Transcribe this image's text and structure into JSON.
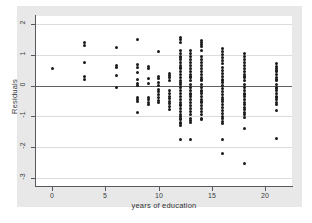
{
  "figure": {
    "background_color": "#e8e8e8",
    "plot_background_color": "#ffffff",
    "point_color": "#1b1b1d",
    "grid_color": "#dcdcde",
    "axis_color": "#55585c",
    "zero_line_color": "#5c6064"
  },
  "chart_data": {
    "type": "scatter",
    "title": "",
    "subtitle": "",
    "xlabel": "years of education",
    "ylabel": "Residuals",
    "xlim": [
      -1.5,
      22.5
    ],
    "ylim": [
      -3.25,
      2.25
    ],
    "xticks": [
      0,
      5,
      10,
      15,
      20
    ],
    "xticklabels": [
      "0",
      "5",
      "10",
      "15",
      "20"
    ],
    "yticks": [
      2,
      1,
      0,
      -1,
      -2,
      -3
    ],
    "yticklabels": [
      "2",
      "1",
      "0",
      "-1",
      "-2",
      "-3"
    ],
    "grid": true,
    "grid_axis": "y",
    "reference_line": {
      "y": 0,
      "style": "solid"
    },
    "legend": null,
    "marker": "filled-circle",
    "series": [
      {
        "name": "residuals",
        "x": [
          0,
          3,
          3,
          3,
          3,
          3,
          6,
          6,
          6,
          6,
          6,
          8,
          8,
          8,
          8,
          8,
          8,
          8,
          8,
          8,
          8,
          8,
          9,
          9,
          9,
          9,
          9,
          9,
          9,
          9,
          10,
          10,
          10,
          10,
          10,
          10,
          10,
          10,
          10,
          10,
          10,
          11,
          11,
          11,
          11,
          11,
          11,
          11,
          11,
          11,
          11,
          11,
          11,
          12,
          12,
          12,
          12,
          12,
          12,
          12,
          12,
          12,
          12,
          12,
          12,
          12,
          12,
          12,
          12,
          12,
          12,
          12,
          12,
          12,
          12,
          12,
          12,
          12,
          12,
          12,
          12,
          12,
          12,
          12,
          12,
          12,
          12,
          12,
          12,
          13,
          13,
          13,
          13,
          13,
          13,
          13,
          13,
          13,
          13,
          13,
          13,
          13,
          13,
          13,
          13,
          13,
          13,
          13,
          13,
          13,
          13,
          13,
          13,
          13,
          13,
          13,
          13,
          14,
          14,
          14,
          14,
          14,
          14,
          14,
          14,
          14,
          14,
          14,
          14,
          14,
          14,
          14,
          14,
          14,
          14,
          14,
          14,
          14,
          14,
          14,
          14,
          14,
          14,
          14,
          14,
          14,
          14,
          16,
          16,
          16,
          16,
          16,
          16,
          16,
          16,
          16,
          16,
          16,
          16,
          16,
          16,
          16,
          16,
          16,
          16,
          16,
          16,
          16,
          16,
          16,
          16,
          16,
          16,
          16,
          16,
          16,
          16,
          18,
          18,
          18,
          18,
          18,
          18,
          18,
          18,
          18,
          18,
          18,
          18,
          18,
          18,
          18,
          18,
          18,
          18,
          18,
          18,
          18,
          18,
          18,
          18,
          18,
          18,
          18,
          21,
          21,
          21,
          21,
          21,
          21,
          21,
          21,
          21,
          21,
          21,
          21,
          21,
          21,
          21,
          21,
          21,
          21,
          21,
          21,
          21
        ],
        "y": [
          0.55,
          1.38,
          1.3,
          0.74,
          0.3,
          0.2,
          1.23,
          0.65,
          0.6,
          0.32,
          -0.07,
          1.49,
          0.68,
          0.6,
          0.42,
          0.18,
          0.08,
          0.0,
          -0.4,
          -0.46,
          -0.52,
          -0.87,
          0.62,
          0.55,
          0.22,
          0.08,
          -0.4,
          -0.46,
          -0.55,
          -0.62,
          1.1,
          0.3,
          0.22,
          0.1,
          0.0,
          -0.12,
          -0.2,
          -0.28,
          -0.38,
          -0.48,
          -0.55,
          0.4,
          0.33,
          0.25,
          0.15,
          -0.15,
          -0.25,
          -0.35,
          -0.42,
          -0.5,
          -0.58,
          -0.68,
          -0.76,
          1.57,
          1.5,
          1.38,
          1.12,
          1.05,
          0.95,
          0.85,
          0.75,
          0.65,
          0.55,
          0.45,
          0.35,
          0.25,
          0.15,
          0.05,
          -0.05,
          -0.15,
          -0.25,
          -0.35,
          -0.45,
          -0.55,
          -0.65,
          -0.75,
          -0.85,
          -0.95,
          -1.0,
          -1.05,
          -1.1,
          -1.18,
          -1.22,
          -1.28,
          -1.75,
          0.9,
          0.6,
          0.1,
          -0.6,
          1.15,
          1.05,
          0.95,
          0.85,
          0.75,
          0.65,
          0.55,
          0.45,
          0.35,
          0.25,
          0.15,
          0.05,
          -0.05,
          -0.15,
          -0.25,
          -0.35,
          -0.45,
          -0.55,
          -0.65,
          -0.75,
          -0.85,
          -0.95,
          -1.05,
          -1.12,
          -1.18,
          -1.75,
          0.3,
          -0.3,
          1.46,
          1.4,
          1.32,
          1.25,
          1.12,
          0.95,
          0.85,
          0.75,
          0.65,
          0.55,
          0.45,
          0.35,
          0.25,
          0.15,
          0.05,
          -0.05,
          -0.15,
          -0.25,
          -0.35,
          -0.45,
          -0.55,
          -0.65,
          -0.75,
          -0.85,
          -0.95,
          -1.05,
          -1.1,
          0.2,
          -0.2,
          -0.5,
          1.2,
          1.1,
          1.0,
          0.9,
          0.8,
          0.7,
          0.6,
          0.5,
          0.4,
          0.3,
          0.2,
          0.1,
          0.0,
          -0.1,
          -0.2,
          -0.3,
          -0.4,
          -0.5,
          -0.6,
          -0.7,
          -0.8,
          -0.9,
          -1.0,
          -1.08,
          -1.15,
          -1.22,
          -1.75,
          -2.2,
          0.15,
          -0.45,
          1.05,
          0.95,
          0.85,
          0.75,
          0.65,
          0.55,
          0.45,
          0.35,
          0.25,
          0.15,
          0.05,
          -0.05,
          -0.15,
          -0.25,
          -0.35,
          -0.45,
          -0.55,
          -0.62,
          -0.7,
          -0.78,
          -0.88,
          -0.95,
          -1.02,
          -1.38,
          -2.53,
          0.3,
          -0.3,
          0.7,
          0.62,
          0.55,
          0.45,
          0.35,
          0.25,
          0.15,
          0.05,
          -0.05,
          -0.15,
          -0.25,
          -0.35,
          -0.45,
          -0.55,
          -0.62,
          -0.8,
          -1.72,
          0.2,
          -0.1,
          -0.4,
          0.5
        ]
      }
    ]
  }
}
